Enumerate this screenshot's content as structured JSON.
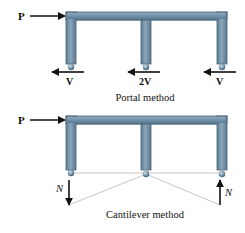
{
  "colors": {
    "frame_fill": "#6e8fa6",
    "frame_edge": "#4a6478",
    "frame_highlight": "#9fb6c6",
    "arrow": "#111111",
    "guide_line": "#b8b8b8",
    "background": "#ffffff"
  },
  "portal": {
    "load_label": "P",
    "reactions": [
      {
        "label": "V",
        "direction": "left"
      },
      {
        "label": "2V",
        "direction": "left"
      },
      {
        "label": "V",
        "direction": "left"
      }
    ],
    "caption": "Portal method"
  },
  "cantilever": {
    "load_label": "P",
    "left_force_label": "N",
    "left_force_direction": "down",
    "right_force_label": "N",
    "right_force_direction": "up",
    "caption": "Cantilever method"
  }
}
